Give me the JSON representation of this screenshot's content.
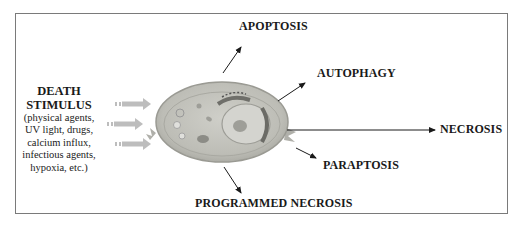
{
  "diagram": {
    "stimulus": {
      "heading_line1": "DEATH",
      "heading_line2": "STIMULUS",
      "details": [
        "(physical agents,",
        "UV light, drugs,",
        "calcium influx,",
        "infectious agents,",
        "hypoxia, etc.)"
      ]
    },
    "center_node": "cell",
    "outcomes": {
      "apoptosis": "APOPTOSIS",
      "autophagy": "AUTOPHAGY",
      "necrosis": "NECROSIS",
      "paraptosis": "PARAPTOSIS",
      "programmed_necrosis": "PROGRAMMED NECROSIS"
    },
    "colors": {
      "border": "#7a7a7a",
      "text": "#1a1a1a",
      "cell_fill": "#b9b9b3",
      "stimulus_arrows": "#bdbdbd"
    }
  }
}
